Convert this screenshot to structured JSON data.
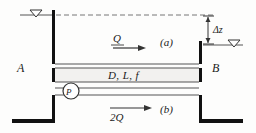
{
  "figure": {
    "type": "engineering-schematic",
    "labels": {
      "reservoir_left": "A",
      "reservoir_right": "B",
      "case_upper": "(a)",
      "case_lower": "(b)",
      "pipe_properties": "D, L, f",
      "flow_upper": "Q",
      "flow_lower": "2Q",
      "head_difference": "Δz",
      "pump": "P"
    },
    "colors": {
      "line": "#1a1a1a",
      "wall": "#111111",
      "pipe_fill": "#f2f1ef",
      "water_line": "#555555",
      "dashed": "#777777"
    }
  }
}
